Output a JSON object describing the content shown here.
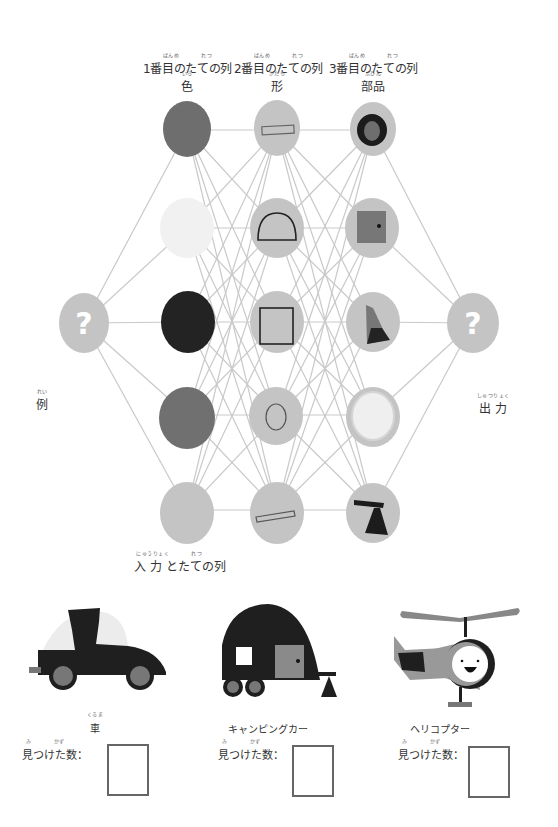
{
  "columns": [
    {
      "heading": "1番目のたての列",
      "heading_furigana": "ばんめ　　　　れつ",
      "sub": "色",
      "sub_furigana": "いろ"
    },
    {
      "heading": "2番目のたての列",
      "heading_furigana": "ばんめ　　　　れつ",
      "sub": "形",
      "sub_furigana": "かたち"
    },
    {
      "heading": "3番目のたての列",
      "heading_furigana": "ばんめ　　　　れつ",
      "sub": "部品",
      "sub_furigana": "ぶひん"
    }
  ],
  "left_label": {
    "text": "例",
    "furigana": "れい"
  },
  "right_label": {
    "text": "出 力",
    "furigana": "しゅつりょく"
  },
  "bottom_label": {
    "text": "入 力 とたての列",
    "furigana": "にゅうりょく　　　　れつ"
  },
  "input_node": {
    "glyph": "?",
    "icon": "question-mark-icon"
  },
  "output_node": {
    "glyph": "?",
    "icon": "question-mark-icon"
  },
  "network": {
    "node_fill": "#c4c4c4",
    "edge_color": "#c8c8c8",
    "column_1_color_nodes": [
      {
        "name": "dark-gray-color-node",
        "fill": "#6e6e6e"
      },
      {
        "name": "white-color-node",
        "fill": "#f1f1f1"
      },
      {
        "name": "black-color-node",
        "fill": "#232323"
      },
      {
        "name": "medium-gray-color-node",
        "fill": "#707070"
      },
      {
        "name": "light-gray-color-node",
        "fill": "#c4c4c4"
      }
    ],
    "column_2_shape_nodes": [
      {
        "name": "thin-rectangle-shape-icon"
      },
      {
        "name": "semicircle-shape-icon"
      },
      {
        "name": "square-shape-icon"
      },
      {
        "name": "circle-shape-icon"
      },
      {
        "name": "tilted-rectangle-shape-icon"
      }
    ],
    "column_3_part_nodes": [
      {
        "name": "tire-wheel-part-icon"
      },
      {
        "name": "door-part-icon"
      },
      {
        "name": "tail-fin-part-icon"
      },
      {
        "name": "window-part-icon"
      },
      {
        "name": "hitch-stand-part-icon"
      }
    ]
  },
  "vehicles": [
    {
      "name": "車",
      "furigana": "くるま",
      "found_label": "見つけた数：",
      "found_furigana_mi": "み",
      "found_furigana_kazu": "かず",
      "count": ""
    },
    {
      "name": "キャンピングカー",
      "furigana": "",
      "found_label": "見つけた数：",
      "found_furigana_mi": "み",
      "found_furigana_kazu": "かず",
      "count": ""
    },
    {
      "name": "ヘリコプター",
      "furigana": "",
      "found_label": "見つけた数：",
      "found_furigana_mi": "み",
      "found_furigana_kazu": "かず",
      "count": ""
    }
  ]
}
